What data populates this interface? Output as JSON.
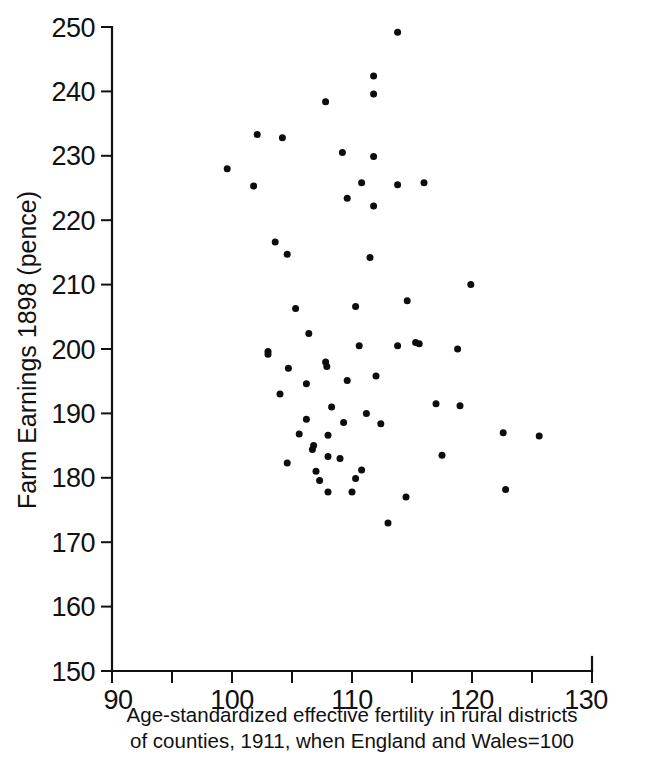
{
  "chart_data": {
    "type": "scatter",
    "title": "",
    "xlabel": "Age-standardized effective fertility in rural districts of counties, 1911, when England and Wales=100",
    "xlabel_line1": "Age-standardized effective fertility in rural districts",
    "xlabel_line2": "of counties, 1911, when England and Wales=100",
    "ylabel": "Farm Earnings 1898  (pence)",
    "xlim": [
      90,
      130
    ],
    "ylim": [
      150,
      250
    ],
    "xticks": [
      90,
      95,
      100,
      105,
      110,
      115,
      120,
      125,
      130
    ],
    "xtick_labels": [
      "90",
      "",
      "100",
      "",
      "110",
      "",
      "120",
      "",
      "130"
    ],
    "yticks": [
      150,
      160,
      170,
      180,
      190,
      200,
      210,
      220,
      230,
      240,
      250
    ],
    "ytick_labels": [
      "150",
      "160",
      "170",
      "180",
      "190",
      "200",
      "210",
      "220",
      "230",
      "240",
      "250"
    ],
    "grid": false,
    "legend": null,
    "marker": "filled-circle",
    "marker_color": "#0d0d0d",
    "marker_size_px": 4.4,
    "n_points": 63,
    "points": [
      {
        "x": 113.8,
        "y": 249.2
      },
      {
        "x": 111.8,
        "y": 242.4
      },
      {
        "x": 111.8,
        "y": 239.6
      },
      {
        "x": 107.8,
        "y": 238.4
      },
      {
        "x": 102.1,
        "y": 233.3
      },
      {
        "x": 104.2,
        "y": 232.8
      },
      {
        "x": 109.2,
        "y": 230.5
      },
      {
        "x": 111.8,
        "y": 229.9
      },
      {
        "x": 99.6,
        "y": 228.0
      },
      {
        "x": 110.8,
        "y": 225.8
      },
      {
        "x": 113.8,
        "y": 225.5
      },
      {
        "x": 116.0,
        "y": 225.8
      },
      {
        "x": 109.6,
        "y": 223.4
      },
      {
        "x": 111.8,
        "y": 222.2
      },
      {
        "x": 103.6,
        "y": 216.6
      },
      {
        "x": 104.6,
        "y": 214.7
      },
      {
        "x": 111.5,
        "y": 214.2
      },
      {
        "x": 119.9,
        "y": 210.0
      },
      {
        "x": 105.3,
        "y": 206.3
      },
      {
        "x": 110.3,
        "y": 206.6
      },
      {
        "x": 114.6,
        "y": 207.5
      },
      {
        "x": 103.0,
        "y": 199.6
      },
      {
        "x": 103.0,
        "y": 199.2
      },
      {
        "x": 110.6,
        "y": 200.5
      },
      {
        "x": 113.8,
        "y": 200.5
      },
      {
        "x": 115.3,
        "y": 201.0
      },
      {
        "x": 115.6,
        "y": 200.8
      },
      {
        "x": 118.8,
        "y": 200.0
      },
      {
        "x": 104.7,
        "y": 197.0
      },
      {
        "x": 107.8,
        "y": 198.0
      },
      {
        "x": 107.9,
        "y": 197.3
      },
      {
        "x": 106.2,
        "y": 194.6
      },
      {
        "x": 109.6,
        "y": 195.1
      },
      {
        "x": 117.0,
        "y": 191.5
      },
      {
        "x": 119.0,
        "y": 191.2
      },
      {
        "x": 122.6,
        "y": 187.0
      },
      {
        "x": 125.6,
        "y": 186.5
      },
      {
        "x": 105.6,
        "y": 186.8
      },
      {
        "x": 108.0,
        "y": 186.6
      },
      {
        "x": 106.8,
        "y": 185.0
      },
      {
        "x": 106.7,
        "y": 184.4
      },
      {
        "x": 104.6,
        "y": 182.3
      },
      {
        "x": 108.0,
        "y": 183.3
      },
      {
        "x": 109.0,
        "y": 183.0
      },
      {
        "x": 107.0,
        "y": 181.0
      },
      {
        "x": 110.8,
        "y": 181.2
      },
      {
        "x": 108.0,
        "y": 177.8
      },
      {
        "x": 110.0,
        "y": 177.8
      },
      {
        "x": 122.8,
        "y": 178.2
      },
      {
        "x": 114.5,
        "y": 177.0
      },
      {
        "x": 113.0,
        "y": 173.0
      },
      {
        "x": 101.8,
        "y": 225.3
      },
      {
        "x": 106.4,
        "y": 202.4
      },
      {
        "x": 108.3,
        "y": 191.0
      },
      {
        "x": 106.2,
        "y": 189.1
      },
      {
        "x": 111.2,
        "y": 190.0
      },
      {
        "x": 112.4,
        "y": 188.4
      },
      {
        "x": 109.3,
        "y": 188.6
      },
      {
        "x": 107.3,
        "y": 179.6
      },
      {
        "x": 112.0,
        "y": 195.8
      },
      {
        "x": 104.0,
        "y": 193.0
      },
      {
        "x": 110.3,
        "y": 179.9
      },
      {
        "x": 117.5,
        "y": 183.5
      }
    ]
  },
  "axis": {
    "y_title": "Farm Earnings 1898  (pence)",
    "x_caption_line1": "Age-standardized effective fertility in rural districts",
    "x_caption_line2": "of counties, 1911, when England and Wales=100"
  }
}
